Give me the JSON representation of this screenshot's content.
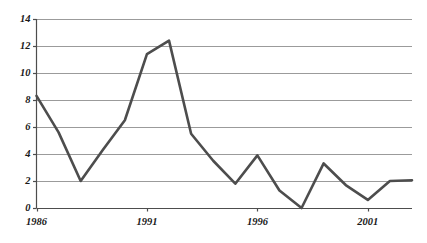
{
  "chart_data": {
    "type": "line",
    "title": "",
    "subtitle": "",
    "xlabel": "",
    "ylabel": "",
    "xlim": [
      1986,
      2003
    ],
    "ylim": [
      0,
      14
    ],
    "grid": true,
    "grid_axis": "y",
    "legend": false,
    "legend_position": "none",
    "line_color": "#4d4d4d",
    "grid_color": "#9b9b9b",
    "axis_color": "#4d4d4d",
    "background": "#ffffff",
    "y_ticks": [
      0,
      2,
      4,
      6,
      8,
      10,
      12,
      14
    ],
    "y_tick_labels": [
      "0",
      "2",
      "4",
      "6",
      "8",
      "10",
      "12",
      "14"
    ],
    "x_ticks": [
      1986,
      1991,
      1996,
      2001
    ],
    "x_tick_labels": [
      "1986",
      "1991",
      "1996",
      "2001"
    ],
    "x": [
      1986,
      1987,
      1988,
      1989,
      1990,
      1991,
      1992,
      1993,
      1994,
      1995,
      1996,
      1997,
      1998,
      1999,
      2000,
      2001,
      2002,
      2003
    ],
    "values": [
      8.3,
      5.6,
      2.0,
      4.3,
      6.5,
      11.4,
      12.4,
      5.5,
      3.5,
      1.8,
      3.9,
      1.3,
      0.0,
      3.3,
      1.7,
      0.6,
      2.0,
      2.05
    ],
    "series": [
      {
        "name": "series-1",
        "color": "#4d4d4d",
        "values": [
          8.3,
          5.6,
          2.0,
          4.3,
          6.5,
          11.4,
          12.4,
          5.5,
          3.5,
          1.8,
          3.9,
          1.3,
          0.0,
          3.3,
          1.7,
          0.6,
          2.0,
          2.05
        ]
      }
    ]
  },
  "axes": {
    "y_labels": [
      "14",
      "12",
      "10",
      "8",
      "6",
      "4",
      "2",
      "0"
    ],
    "x_labels": [
      "1986",
      "1991",
      "1996",
      "2001"
    ]
  }
}
